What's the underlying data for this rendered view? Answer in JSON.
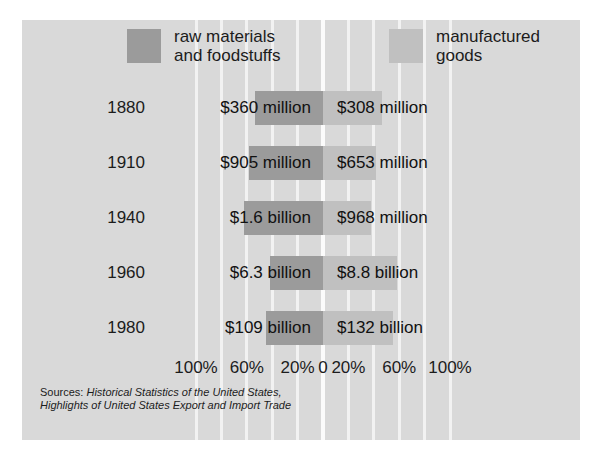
{
  "legend": {
    "items": [
      {
        "label": "raw materials\nand foodstuffs",
        "color": "#9b9b9b",
        "key": "raw"
      },
      {
        "label": "manufactured\ngoods",
        "color": "#c0c0c0",
        "key": "mfg"
      }
    ]
  },
  "axis": {
    "ticks": [
      "100%",
      "60%",
      "20%",
      "0",
      "20%",
      "60%",
      "100%"
    ]
  },
  "sources": {
    "lead": "Sources: ",
    "line1": "Historical Statistics of the United States,",
    "line2": "Highlights of United States Export and Import Trade"
  },
  "chart_data": {
    "type": "bar",
    "orientation": "horizontal-diverging",
    "title": "",
    "xlabel": "",
    "ylabel": "",
    "categories": [
      "1880",
      "1910",
      "1940",
      "1960",
      "1980"
    ],
    "xlim": [
      -100,
      100
    ],
    "xticks": [
      -100,
      -60,
      -20,
      0,
      20,
      60,
      100
    ],
    "grid": true,
    "legend_position": "top",
    "series": [
      {
        "name": "raw materials and foodstuffs",
        "color": "#9b9b9b",
        "side": "left",
        "labels": [
          "$360 million",
          "$905 million",
          "$1.6 billion",
          "$6.3 billion",
          "$109 billion"
        ],
        "values": [
          53.9,
          58.1,
          62.3,
          41.7,
          45.2
        ]
      },
      {
        "name": "manufactured goods",
        "color": "#c0c0c0",
        "side": "right",
        "labels": [
          "$308 million",
          "$653 million",
          "$968 million",
          "$8.8 billion",
          "$132 billion"
        ],
        "values": [
          46.1,
          41.9,
          37.7,
          58.3,
          54.8
        ]
      }
    ]
  }
}
